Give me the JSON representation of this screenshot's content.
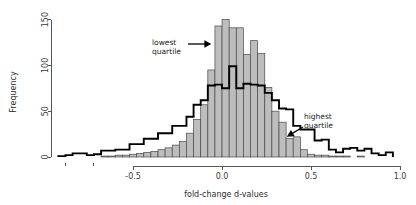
{
  "chart_data": {
    "type": "bar",
    "title": "",
    "subtitle": "",
    "xlabel": "fold-change d-values",
    "ylabel": "Frequency",
    "xlim": [
      -0.95,
      1.0
    ],
    "ylim": [
      0,
      155
    ],
    "grid": false,
    "legend_position": "none",
    "xticks": [
      -0.5,
      0.0,
      0.5,
      1.0
    ],
    "xtick_labels": [
      "-0.5",
      "0.0",
      "0.5",
      "1.0"
    ],
    "yticks": [
      0,
      50,
      100,
      150
    ],
    "ytick_labels": [
      "0",
      "50",
      "100",
      "150"
    ],
    "bin_width": 0.04,
    "series": [
      {
        "name": "lowest quartile",
        "render": "filled-bars",
        "fill": "#bdbdbd",
        "stroke": "#4a4a4a",
        "bin_starts": [
          -0.92,
          -0.88,
          -0.84,
          -0.8,
          -0.76,
          -0.72,
          -0.68,
          -0.64,
          -0.6,
          -0.56,
          -0.52,
          -0.48,
          -0.44,
          -0.4,
          -0.36,
          -0.32,
          -0.28,
          -0.24,
          -0.2,
          -0.16,
          -0.12,
          -0.08,
          -0.04,
          0.0,
          0.04,
          0.08,
          0.12,
          0.16,
          0.2,
          0.24,
          0.28,
          0.32,
          0.36,
          0.4,
          0.44,
          0.48,
          0.52,
          0.56,
          0.6,
          0.64,
          0.68,
          0.72,
          0.76,
          0.8,
          0.84,
          0.88,
          0.92
        ],
        "values": [
          0,
          0,
          0,
          0,
          0,
          0,
          1,
          1,
          2,
          2,
          3,
          4,
          5,
          6,
          8,
          10,
          13,
          17,
          26,
          41,
          57,
          95,
          143,
          150,
          141,
          141,
          112,
          127,
          113,
          76,
          50,
          38,
          20,
          22,
          8,
          3,
          2,
          2,
          1,
          1,
          1,
          0,
          1,
          0,
          0,
          0,
          0
        ]
      },
      {
        "name": "highest quartile",
        "render": "step-outline",
        "stroke": "#000000",
        "bin_starts": [
          -0.92,
          -0.88,
          -0.84,
          -0.8,
          -0.76,
          -0.72,
          -0.68,
          -0.64,
          -0.6,
          -0.56,
          -0.52,
          -0.48,
          -0.44,
          -0.4,
          -0.36,
          -0.32,
          -0.28,
          -0.24,
          -0.2,
          -0.16,
          -0.12,
          -0.08,
          -0.04,
          0.0,
          0.04,
          0.08,
          0.12,
          0.16,
          0.2,
          0.24,
          0.28,
          0.32,
          0.36,
          0.4,
          0.44,
          0.48,
          0.52,
          0.56,
          0.6,
          0.64,
          0.68,
          0.72,
          0.76,
          0.8,
          0.84,
          0.88,
          0.92
        ],
        "values": [
          1,
          2,
          4,
          4,
          2,
          3,
          7,
          7,
          8,
          8,
          14,
          14,
          20,
          20,
          26,
          26,
          34,
          34,
          44,
          57,
          62,
          78,
          79,
          75,
          99,
          75,
          80,
          79,
          78,
          70,
          62,
          53,
          52,
          34,
          30,
          30,
          18,
          19,
          8,
          5,
          9,
          10,
          7,
          9,
          4,
          2,
          5
        ]
      }
    ],
    "annotations": [
      {
        "id": "lowest-quartile",
        "lines": [
          "lowest",
          "quartile"
        ],
        "text_x": 152,
        "text_y": 45,
        "arrow": {
          "x1": 188,
          "y1": 44,
          "x2": 210,
          "y2": 44
        }
      },
      {
        "id": "highest-quartile",
        "lines": [
          "highest",
          "quartile"
        ],
        "text_x": 304,
        "text_y": 119,
        "arrow": {
          "x1": 303,
          "y1": 127,
          "x2": 288,
          "y2": 136
        }
      }
    ]
  },
  "figure": {
    "plot_left": 53,
    "plot_right": 400,
    "plot_bottom": 157,
    "plot_top": 15,
    "axis_y_x": 51,
    "axis_x_y": 166
  }
}
